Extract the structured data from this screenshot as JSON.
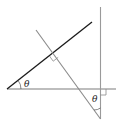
{
  "diagram": {
    "type": "geometry",
    "labels": {
      "theta_left": "θ",
      "theta_bottom": "θ"
    },
    "colors": {
      "dark_line": "#1a1a1a",
      "gray_line": "#8a8a8a",
      "background": "#ffffff"
    },
    "elements": [
      {
        "name": "horizontal-base-line",
        "color": "gray"
      },
      {
        "name": "inclined-line",
        "color": "black"
      },
      {
        "name": "perpendicular-transversal",
        "color": "gray"
      },
      {
        "name": "vertical-line",
        "color": "gray"
      },
      {
        "name": "right-angle-marker-upper"
      },
      {
        "name": "right-angle-marker-lower"
      }
    ]
  }
}
